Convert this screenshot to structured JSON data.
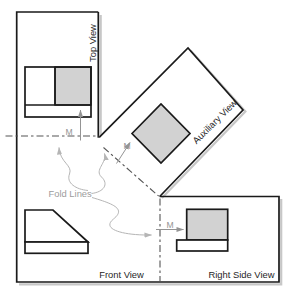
{
  "diagram": {
    "labels": {
      "top_view": "Top View",
      "auxiliary_view": "Auxiliary View",
      "front_view": "Front View",
      "right_side_view": "Right Side View",
      "fold_lines": "Fold Lines",
      "dim_top": "M",
      "dim_aux": "M",
      "dim_right": "M"
    },
    "colors": {
      "line": "#1a1a1a",
      "surface_fill": "#d2d2d2",
      "fold_line": "#555555",
      "dimension": "#979797",
      "leader": "#b5b5b5",
      "shadow": "#c7c7c7",
      "background": "#ffffff"
    }
  }
}
